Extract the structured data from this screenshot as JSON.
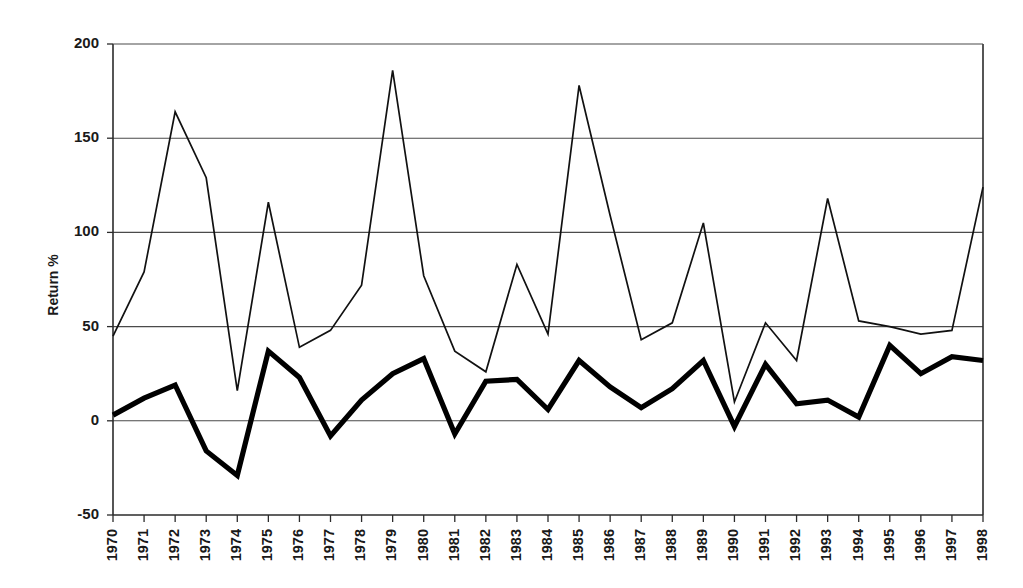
{
  "chart_data": {
    "type": "line",
    "title": "",
    "xlabel": "",
    "ylabel": "Return %",
    "grid": "horizontal",
    "legend": "none",
    "xlim": [
      1970,
      1998
    ],
    "ylim": [
      -50,
      200
    ],
    "ytick_labels": [
      "200",
      "150",
      "100",
      "50",
      "0",
      "-50"
    ],
    "ytick_values": [
      200,
      150,
      100,
      50,
      0,
      -50
    ],
    "categories": [
      "1970",
      "1971",
      "1972",
      "1973",
      "1974",
      "1975",
      "1976",
      "1977",
      "1978",
      "1979",
      "1980",
      "1981",
      "1982",
      "1983",
      "1984",
      "1985",
      "1986",
      "1987",
      "1988",
      "1989",
      "1990",
      "1991",
      "1992",
      "1993",
      "1994",
      "1995",
      "1996",
      "1997",
      "1998"
    ],
    "series": [
      {
        "name": "thin-line-series",
        "style": "thin",
        "color": "#111111",
        "values": [
          45,
          79,
          164,
          129,
          16,
          116,
          39,
          48,
          72,
          186,
          77,
          37,
          26,
          83,
          46,
          178,
          109,
          43,
          52,
          105,
          10,
          52,
          32,
          118,
          53,
          50,
          46,
          48,
          124
        ]
      },
      {
        "name": "bold-line-series",
        "style": "bold",
        "color": "#000000",
        "values": [
          3,
          12,
          19,
          -16,
          -29,
          37,
          23,
          -8,
          11,
          25,
          33,
          -7,
          21,
          22,
          6,
          32,
          18,
          7,
          17,
          32,
          -3,
          30,
          9,
          11,
          2,
          40,
          25,
          34,
          32
        ]
      }
    ]
  }
}
